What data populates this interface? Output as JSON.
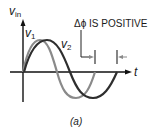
{
  "figure": {
    "y_axis_label": "v",
    "y_axis_sub": "in",
    "x_axis_label": "t",
    "series": [
      {
        "name": "v",
        "sub": "1",
        "color": "#8a8a8a"
      },
      {
        "name": "v",
        "sub": "2",
        "color": "#2e2e2e"
      }
    ],
    "annotation": "Δϕ IS POSITIVE",
    "caption": "(a)",
    "colors": {
      "axis": "#111111",
      "marker": "#222222",
      "arrow": "#8a8a8a"
    }
  }
}
